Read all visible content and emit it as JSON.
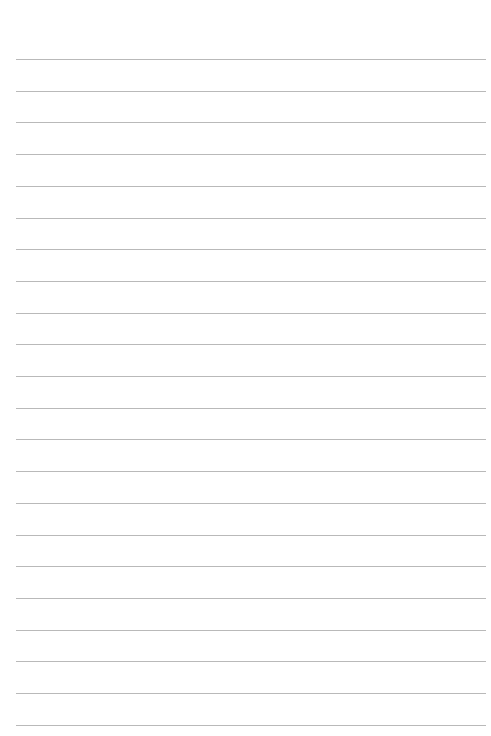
{
  "page": {
    "type": "lined-paper",
    "background_color": "#ffffff",
    "line_color": "#b9b9b9",
    "line_count": 22,
    "first_line_y": 59,
    "line_spacing": 31.7,
    "line_left": 16,
    "line_width": 470,
    "text": ""
  }
}
